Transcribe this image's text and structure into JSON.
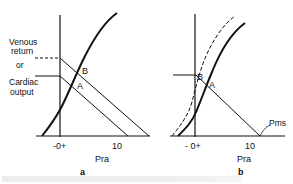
{
  "figure": {
    "type": "diagram",
    "caption_visible": false
  },
  "panel_a": {
    "letter": "a",
    "y_label_lines": [
      "Venous",
      "return",
      "or",
      "Cardiac",
      "output"
    ],
    "x_label": "Pra",
    "x_ticks": [
      "-0+",
      "10"
    ],
    "points": [
      "A",
      "B"
    ]
  },
  "panel_b": {
    "letter": "b",
    "x_label": "Pra",
    "x_ticks": [
      "- 0+",
      "10"
    ],
    "points": [
      "B",
      "A"
    ],
    "annotation": "Pms"
  },
  "colors": {
    "ink": "#111111",
    "background": "#ffffff"
  }
}
